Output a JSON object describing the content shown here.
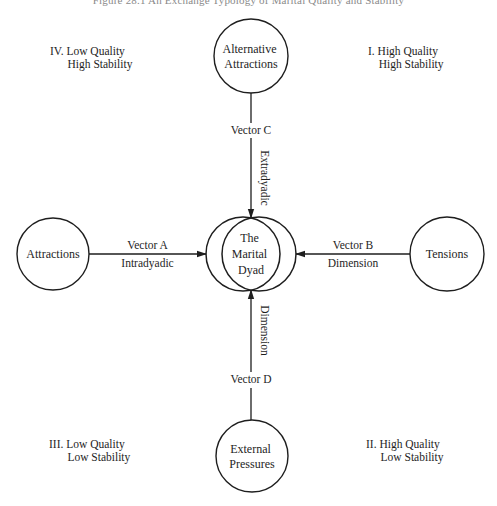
{
  "figure": {
    "title": "Figure 28.1   An Exchange Typology of Marital Quality and Stability"
  },
  "quadrants": [
    {
      "id": "IV",
      "numeral": "IV.",
      "line1": "Low Quality",
      "line2": "High Stability",
      "x": 50,
      "y": 45
    },
    {
      "id": "I",
      "numeral": "I.",
      "line1": "High Quality",
      "line2": "High Stability",
      "x": 368,
      "y": 45
    },
    {
      "id": "III",
      "numeral": "III.",
      "line1": "Low Quality",
      "line2": "Low Stability",
      "x": 49,
      "y": 438
    },
    {
      "id": "II",
      "numeral": "II.",
      "line1": "High Quality",
      "line2": "Low Stability",
      "x": 366,
      "y": 438
    }
  ],
  "nodes": {
    "top": {
      "label_lines": [
        "Alternative",
        "Attractions"
      ],
      "cx": 251,
      "cy": 56,
      "r": 37
    },
    "left": {
      "label_lines": [
        "Attractions"
      ],
      "cx": 53,
      "cy": 254,
      "r": 36
    },
    "right": {
      "label_lines": [
        "Tensions"
      ],
      "cx": 447,
      "cy": 254,
      "r": 37
    },
    "bottom": {
      "label_lines": [
        "External",
        "Pressures"
      ],
      "cx": 252,
      "cy": 456,
      "r": 36
    }
  },
  "center": {
    "label_lines": [
      "The",
      "Marital",
      "Dyad"
    ],
    "cx": 251,
    "cy": 254,
    "r": 37,
    "offset": 8
  },
  "vectors": {
    "A": {
      "label": "Vector A",
      "sublabel": "Intradyadic",
      "from": "left",
      "to": "center"
    },
    "B": {
      "label": "Vector B",
      "sublabel": "Dimension",
      "from": "right",
      "to": "center"
    },
    "C": {
      "label": "Vector C",
      "sublabel": "Extradyadic",
      "from": "top",
      "to": "center"
    },
    "D": {
      "label": "Vector D",
      "sublabel": "Dimension",
      "from": "bottom",
      "to": "center"
    }
  },
  "style": {
    "stroke": "#1e1e1e",
    "text": "#1e1e1e",
    "title": "#8a8a8a",
    "background": "#ffffff"
  }
}
